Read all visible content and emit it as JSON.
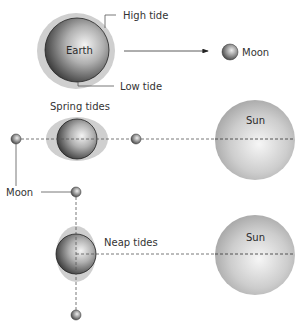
{
  "labels": {
    "earth": "Earth",
    "high_tide": "High tide",
    "low_tide": "Low tide",
    "moon_top": "Moon",
    "spring_tides": "Spring tides",
    "moon_side": "Moon",
    "neap_tides": "Neap tides",
    "sun_spring": "Sun",
    "sun_neap": "Sun"
  },
  "colors": {
    "tidal_bulge": "#cfcfcf",
    "sphere_dark": "#3a3a3a",
    "sphere_light": "#f2f2f2",
    "sun_light": "#f5f5f5",
    "sun_dark": "#a8a8a8",
    "line": "#555555"
  },
  "panels": [
    {
      "name": "earth-moon-tides",
      "objects": [
        "Earth",
        "Moon"
      ],
      "annotations": [
        "High tide",
        "Low tide"
      ]
    },
    {
      "name": "spring-tides",
      "objects": [
        "Moon",
        "Earth",
        "Moon",
        "Sun"
      ],
      "alignment": "moon and sun in line"
    },
    {
      "name": "neap-tides",
      "objects": [
        "Moon",
        "Earth",
        "Moon",
        "Sun"
      ],
      "alignment": "moon at right angle to sun"
    }
  ]
}
